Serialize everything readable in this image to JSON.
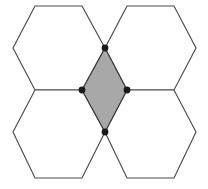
{
  "figure": {
    "type": "geometric-diagram",
    "canvas": {
      "width": 208,
      "height": 189,
      "background": "#ffffff"
    },
    "colors": {
      "hexagon_fill": "#ffffff",
      "hexagon_stroke": "#4a4a4a",
      "rhombus_fill": "#a8a8a8",
      "rhombus_stroke": "#3a3a3a",
      "vertex_dot": "#1a1a1a"
    },
    "stroke_width": 1.15,
    "vertex_dot_radius": 3.4,
    "hexagons": [
      {
        "name": "top-left-hexagon",
        "points": "35,6 82,6 105,48 82,90 35,90 13,48"
      },
      {
        "name": "top-right-hexagon",
        "points": "127,6 174,6 196,48 174,90 127,90 105,48"
      },
      {
        "name": "bottom-left-hexagon",
        "points": "35,90 82,90 105,132 82,178 35,178 13,132"
      },
      {
        "name": "bottom-right-hexagon",
        "points": "127,90 174,90 196,132 174,178 127,178 105,132"
      }
    ],
    "rhombus": {
      "name": "central-shaded-rhombus",
      "points": "105,48 127,90 105,132 82,90",
      "fill": "#a8a8a8"
    },
    "vertices": [
      {
        "name": "top-vertex",
        "cx": 105,
        "cy": 48
      },
      {
        "name": "right-vertex",
        "cx": 127,
        "cy": 90
      },
      {
        "name": "bottom-vertex",
        "cx": 105,
        "cy": 132
      },
      {
        "name": "left-vertex",
        "cx": 82,
        "cy": 90
      }
    ]
  }
}
